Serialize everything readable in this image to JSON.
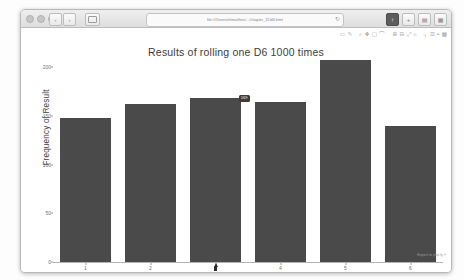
{
  "window": {
    "url": "file:///Users/ehmatthes/.../chapter_15/d6.html",
    "reload_icon": "↻",
    "traffic_lights": [
      "close",
      "minimize",
      "zoom"
    ],
    "nav_buttons": [
      {
        "name": "back-button",
        "glyph": "‹"
      },
      {
        "name": "forward-button",
        "glyph": "›"
      }
    ],
    "sidebar_button": "sidebar-toggle",
    "right_buttons": [
      {
        "name": "share-button",
        "glyph": "↑"
      },
      {
        "name": "add-tab-button",
        "glyph": "+"
      },
      {
        "name": "tab-overview-button",
        "glyph": "▤"
      },
      {
        "name": "downloads-button",
        "glyph": "▦"
      }
    ]
  },
  "modebar": {
    "items": [
      {
        "name": "download-plot-icon",
        "glyph": "▭"
      },
      {
        "name": "edit-in-chart-studio-icon",
        "glyph": "✎"
      },
      {
        "name": "zoom-icon",
        "glyph": "⌕"
      },
      {
        "name": "pan-icon",
        "glyph": "✥"
      },
      {
        "name": "box-select-icon",
        "glyph": "▢"
      },
      {
        "name": "lasso-select-icon",
        "glyph": "⌒"
      },
      {
        "name": "zoom-in-icon",
        "glyph": "⊞"
      },
      {
        "name": "zoom-out-icon",
        "glyph": "⊟"
      },
      {
        "name": "autoscale-icon",
        "glyph": "⤢"
      },
      {
        "name": "reset-axes-icon",
        "glyph": "⌂"
      },
      {
        "name": "toggle-spike-lines-icon",
        "glyph": "┐"
      },
      {
        "name": "hover-compare-icon",
        "glyph": "☰"
      },
      {
        "name": "hover-closest-icon",
        "glyph": "▪"
      },
      {
        "name": "plotly-logo-icon",
        "glyph": "▩"
      }
    ]
  },
  "footer": {
    "export_link": "Export to plot.ly »"
  },
  "tooltip": {
    "visible": true,
    "text": "169"
  },
  "chart_data": {
    "type": "bar",
    "title": "Results of rolling one D6 1000 times",
    "xlabel": "Result",
    "ylabel": "Frequency of Result",
    "categories": [
      "1",
      "2",
      "3",
      "4",
      "5",
      "6"
    ],
    "values": [
      148,
      162,
      169,
      165,
      208,
      140
    ],
    "ylim": [
      0,
      220
    ],
    "yticks": [
      0,
      50,
      100,
      150,
      200
    ],
    "ytick_labels": [
      "0",
      "50",
      "100",
      "150",
      "200"
    ],
    "grid": false,
    "legend": "none",
    "bar_color": "#4a4a4a"
  }
}
